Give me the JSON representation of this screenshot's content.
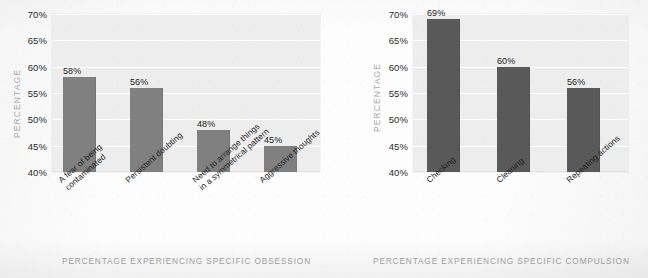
{
  "chart_data": [
    {
      "id": "obsession",
      "type": "bar",
      "title": "",
      "xlabel": "PERCENTAGE EXPERIENCING SPECIFIC OBSESSION",
      "ylabel": "PERCENTAGE",
      "ylim": [
        40,
        70
      ],
      "ytick_labels": [
        "70%",
        "65%",
        "60%",
        "55%",
        "50%",
        "45%",
        "40%"
      ],
      "ytick_values": [
        70,
        65,
        60,
        55,
        50,
        45,
        40
      ],
      "grid": true,
      "legend": "none",
      "bar_color": "#808080",
      "plot_background": "#ededed",
      "categories": [
        "A fear of being contaminated",
        "Persistent doubting",
        "Need to arrange things in a symmetrical pattern",
        "Aggressive thoughts"
      ],
      "category_lines": [
        [
          "A fear of being",
          "contaminated"
        ],
        [
          "Persistent doubting",
          ""
        ],
        [
          "Need to arrange things",
          "in a symmetrical pattern"
        ],
        [
          "Aggressive thoughts",
          ""
        ]
      ],
      "values": [
        58,
        56,
        48,
        45
      ],
      "value_labels": [
        "58%",
        "56%",
        "48%",
        "45%"
      ]
    },
    {
      "id": "compulsion",
      "type": "bar",
      "title": "",
      "xlabel": "PERCENTAGE EXPERIENCING SPECIFIC COMPULSION",
      "ylabel": "PERCENTAGE",
      "ylim": [
        40,
        70
      ],
      "ytick_labels": [
        "70%",
        "65%",
        "60%",
        "55%",
        "50%",
        "45%",
        "40%"
      ],
      "ytick_values": [
        70,
        65,
        60,
        55,
        50,
        45,
        40
      ],
      "grid": true,
      "legend": "none",
      "bar_color": "#595959",
      "plot_background": "#ededed",
      "categories": [
        "Checking",
        "Cleaning",
        "Repeating actions"
      ],
      "category_lines": [
        [
          "Checking",
          ""
        ],
        [
          "Cleaning",
          ""
        ],
        [
          "Repeating actions",
          ""
        ]
      ],
      "values": [
        69,
        60,
        56
      ],
      "value_labels": [
        "69%",
        "60%",
        "56%"
      ]
    }
  ]
}
